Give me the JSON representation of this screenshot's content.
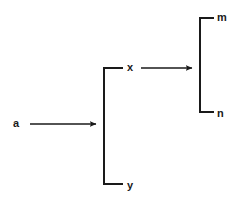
{
  "diagram": {
    "type": "bracket-expansion-diagram",
    "background_color": "#ffffff",
    "stroke_color": "#1a1a1a",
    "stroke_width": 2,
    "nodes": [
      {
        "id": "a",
        "label": "a",
        "x": 13,
        "y": 118,
        "role": "source-symbol"
      },
      {
        "id": "x",
        "label": "x",
        "x": 127,
        "y": 62,
        "role": "branch-top"
      },
      {
        "id": "y",
        "label": "y",
        "x": 127,
        "y": 180,
        "role": "branch-bottom"
      },
      {
        "id": "m",
        "label": "m",
        "x": 217,
        "y": 12,
        "role": "leaf-top"
      },
      {
        "id": "n",
        "label": "n",
        "x": 217,
        "y": 108,
        "role": "leaf-bottom"
      }
    ],
    "arrows": [
      {
        "id": "arrow-a-to-xy",
        "from": "a",
        "to": "bracket-xy",
        "x1": 30,
        "y1": 124,
        "x2": 100,
        "y2": 124
      },
      {
        "id": "arrow-x-to-mn",
        "from": "x",
        "to": "bracket-mn",
        "x1": 141,
        "y1": 68,
        "x2": 196,
        "y2": 68
      }
    ],
    "brackets": [
      {
        "id": "bracket-xy",
        "contains": [
          "x",
          "y"
        ],
        "spine_x": 103,
        "top_y": 67,
        "bottom_y": 185,
        "arm_x": 122
      },
      {
        "id": "bracket-mn",
        "contains": [
          "m",
          "n"
        ],
        "spine_x": 199,
        "top_y": 17,
        "bottom_y": 113,
        "arm_x": 213
      }
    ]
  }
}
